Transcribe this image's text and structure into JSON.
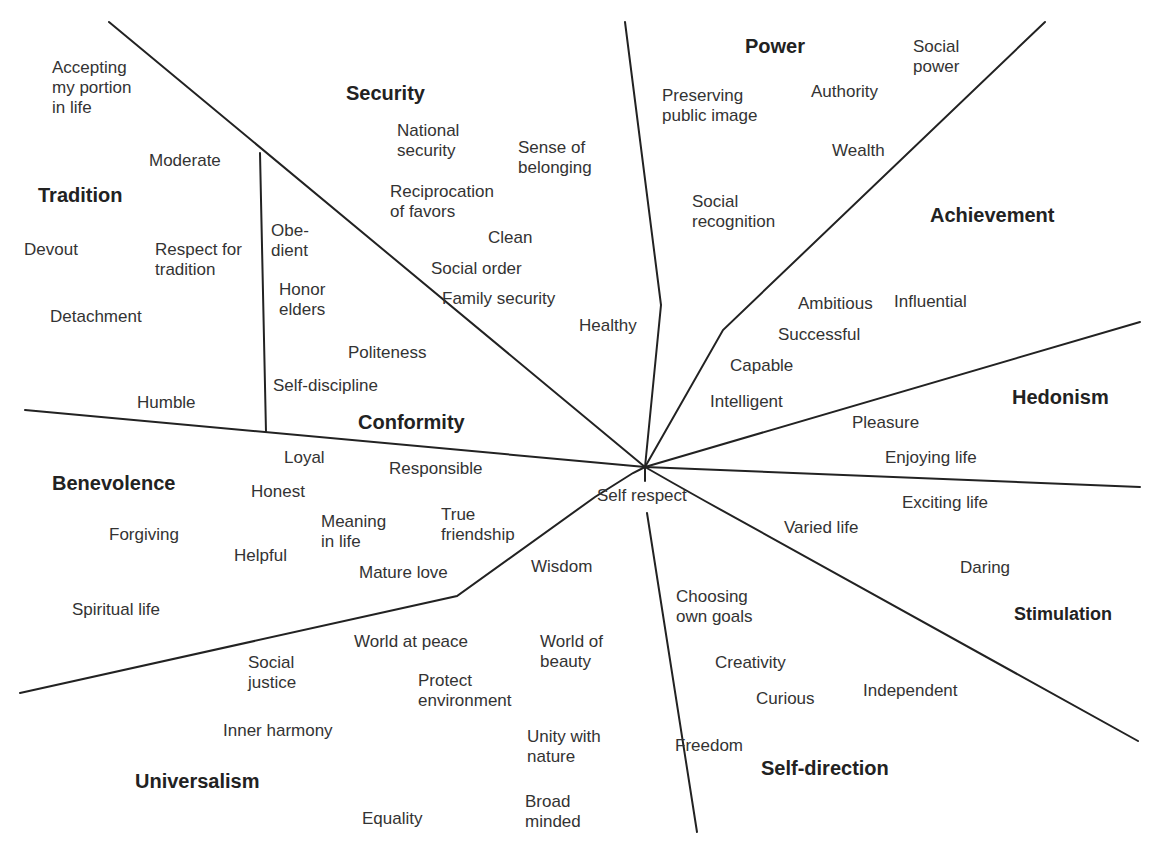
{
  "diagram": {
    "center_value": "Self respect",
    "categories": [
      {
        "name": "Security",
        "values": [
          "National\nsecurity",
          "Sense of\nbelonging",
          "Reciprocation\nof favors",
          "Clean",
          "Social order",
          "Family security",
          "Healthy"
        ]
      },
      {
        "name": "Power",
        "values": [
          "Social\npower",
          "Authority",
          "Preserving\npublic image",
          "Wealth",
          "Social\nrecognition"
        ]
      },
      {
        "name": "Achievement",
        "values": [
          "Ambitious",
          "Influential",
          "Successful",
          "Capable",
          "Intelligent"
        ]
      },
      {
        "name": "Hedonism",
        "values": [
          "Pleasure",
          "Enjoying life"
        ]
      },
      {
        "name": "Stimulation",
        "values": [
          "Exciting life",
          "Varied life",
          "Daring"
        ]
      },
      {
        "name": "Self-direction",
        "values": [
          "Choosing\nown goals",
          "Creativity",
          "Curious",
          "Independent",
          "Freedom"
        ]
      },
      {
        "name": "Universalism",
        "values": [
          "World at peace",
          "World of\nbeauty",
          "Social\njustice",
          "Protect\nenvironment",
          "Inner harmony",
          "Unity with\nnature",
          "Equality",
          "Broad\nminded",
          "Wisdom"
        ]
      },
      {
        "name": "Benevolence",
        "values": [
          "Loyal",
          "Responsible",
          "Honest",
          "Meaning\nin life",
          "True\nfriendship",
          "Forgiving",
          "Helpful",
          "Mature love",
          "Spiritual life"
        ]
      },
      {
        "name": "Conformity",
        "values": [
          "Obe-\ndient",
          "Honor\nelders",
          "Politeness",
          "Self-discipline"
        ]
      },
      {
        "name": "Tradition",
        "values": [
          "Accepting\nmy portion\nin life",
          "Moderate",
          "Devout",
          "Respect for\ntradition",
          "Detachment",
          "Humble"
        ]
      }
    ]
  }
}
